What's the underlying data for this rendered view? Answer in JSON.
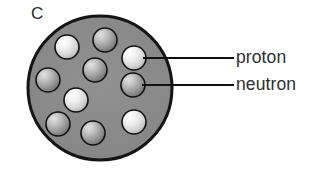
{
  "figure": {
    "title_label": "C",
    "nucleus": {
      "name": "nucleus",
      "fill_color": "#8a8a8a",
      "outline_color": "#141414",
      "center_x": 100,
      "center_y": 88,
      "radius": 72,
      "outline_width": 3
    },
    "particle_types": {
      "proton": {
        "label": "proton",
        "light_color": "#f2f2f2",
        "mid_color": "#d2d2d2",
        "edge_color": "#9c9c9c"
      },
      "neutron": {
        "label": "neutron",
        "light_color": "#d8d8d8",
        "mid_color": "#9a9a9a",
        "edge_color": "#6a6a6a"
      }
    },
    "particles": [
      {
        "id": "p1",
        "type": "proton",
        "cx": 67,
        "cy": 47,
        "r": 12
      },
      {
        "id": "n1",
        "type": "neutron",
        "cx": 105,
        "cy": 40,
        "r": 12
      },
      {
        "id": "p2",
        "type": "proton",
        "cx": 134,
        "cy": 58,
        "r": 12
      },
      {
        "id": "n2",
        "type": "neutron",
        "cx": 95,
        "cy": 70,
        "r": 12
      },
      {
        "id": "n3",
        "type": "neutron",
        "cx": 48,
        "cy": 80,
        "r": 12
      },
      {
        "id": "n4",
        "type": "neutron",
        "cx": 133,
        "cy": 85,
        "r": 12
      },
      {
        "id": "p3",
        "type": "proton",
        "cx": 76,
        "cy": 100,
        "r": 12
      },
      {
        "id": "n5",
        "type": "neutron",
        "cx": 58,
        "cy": 124,
        "r": 12
      },
      {
        "id": "n6",
        "type": "neutron",
        "cx": 93,
        "cy": 133,
        "r": 12
      },
      {
        "id": "p4",
        "type": "proton",
        "cx": 134,
        "cy": 122,
        "r": 12
      }
    ],
    "callouts": [
      {
        "id": "callout-proton",
        "label": "proton",
        "line_x1": 143,
        "line_y1": 58,
        "line_x2": 234,
        "line_y2": 58,
        "line_color": "#111111",
        "line_width": 2
      },
      {
        "id": "callout-neutron",
        "label": "neutron",
        "line_x1": 142,
        "line_y1": 85,
        "line_x2": 234,
        "line_y2": 85,
        "line_color": "#111111",
        "line_width": 2
      }
    ]
  }
}
